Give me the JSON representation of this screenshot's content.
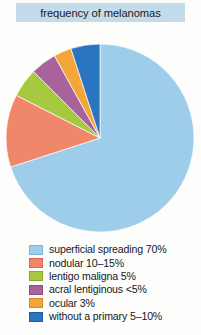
{
  "chart_data": {
    "type": "pie",
    "title": "frequency of melanomas",
    "xlabel": "",
    "ylabel": "",
    "legend_position": "bottom-left",
    "grid": false,
    "start_angle_deg": 0,
    "direction": "clockwise",
    "categories": [
      "superficial spreading",
      "nodular",
      "lentigo maligna",
      "acral lentiginous",
      "ocular",
      "without a primary"
    ],
    "value_labels": [
      "70%",
      "10–15%",
      "5%",
      "<5%",
      "3%",
      "5–10%"
    ],
    "values": [
      70,
      12.5,
      5,
      4.5,
      3,
      7.5
    ],
    "colors": [
      "#9ecde9",
      "#f0876a",
      "#a6c93f",
      "#a8629c",
      "#f4a63a",
      "#2a74c0"
    ],
    "slices": [
      {
        "label": "superficial spreading",
        "value_label": "70%",
        "value": 70,
        "color": "#9ecde9",
        "start_deg": 0,
        "sweep_deg": 252
      },
      {
        "label": "nodular",
        "value_label": "10–15%",
        "value": 12.5,
        "color": "#f0876a",
        "start_deg": 252,
        "sweep_deg": 45
      },
      {
        "label": "lentigo maligna",
        "value_label": "5%",
        "value": 5,
        "color": "#a6c93f",
        "start_deg": 297,
        "sweep_deg": 18
      },
      {
        "label": "acral lentiginous",
        "value_label": "<5%",
        "value": 4.5,
        "color": "#a8629c",
        "start_deg": 315,
        "sweep_deg": 16
      },
      {
        "label": "ocular",
        "value_label": "3%",
        "value": 3,
        "color": "#f4a63a",
        "start_deg": 331,
        "sweep_deg": 11
      },
      {
        "label": "without a primary",
        "value_label": "5–10%",
        "value": 7.5,
        "color": "#2a74c0",
        "start_deg": 342,
        "sweep_deg": 18
      }
    ]
  },
  "header": {
    "title": "frequency of melanomas",
    "background_color": "#c4dcea"
  },
  "legend": {
    "items": [
      {
        "label": "superficial spreading 70%",
        "color": "#9ecde9",
        "border": "#7fb3d5"
      },
      {
        "label": "nodular 10–15%",
        "color": "#f0876a",
        "border": "#d86a50"
      },
      {
        "label": "lentigo maligna 5%",
        "color": "#a6c93f",
        "border": "#88ab2c"
      },
      {
        "label": "acral lentiginous <5%",
        "color": "#a8629c",
        "border": "#8e4d84"
      },
      {
        "label": "ocular 3%",
        "color": "#f4a63a",
        "border": "#d78a22"
      },
      {
        "label": "without a primary 5–10%",
        "color": "#2a74c0",
        "border": "#1d5c9e"
      }
    ]
  }
}
